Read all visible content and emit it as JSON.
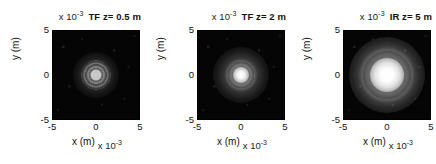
{
  "figure": {
    "background": "#ffffff",
    "colormap": "gray",
    "panel_count": 3
  },
  "common": {
    "exp_prefix": "x 10",
    "exp_power": "-3",
    "xlabel": "x (m)",
    "ylabel": "y (m)",
    "ytick_top": "5",
    "ytick_mid": "0",
    "ytick_bottom": "-5",
    "xtick_left": "-5",
    "xtick_mid": "0",
    "xtick_right": "5"
  },
  "panels": [
    {
      "id": "panel-tf-z05",
      "title": "TF z= 0.5 m",
      "method": "TF",
      "distance": "0.5 m"
    },
    {
      "id": "panel-tf-z2",
      "title": "TF z= 2 m",
      "method": "TF",
      "distance": "2 m"
    },
    {
      "id": "panel-ir-z5",
      "title": "IR z= 5 m",
      "method": "IR",
      "distance": "5 m"
    }
  ],
  "chart_data": [
    {
      "type": "heatmap",
      "title": "TF z= 0.5 m",
      "xlabel": "x (m)",
      "ylabel": "y (m)",
      "xlim": [
        -0.005,
        0.005
      ],
      "ylim": [
        -0.005,
        0.005
      ],
      "xticks": [
        -5,
        0,
        5
      ],
      "yticks": [
        -5,
        0,
        5
      ],
      "tick_scale": "x 10^-3",
      "colormap": "gray",
      "grid": false,
      "legend": "none",
      "description": "Simulated diffraction intensity pattern, transfer-function propagator at z = 0.5 m. Small concentric-ring central spot on a dark background.",
      "peak_position": [
        0,
        0
      ],
      "peak_intensity_relative": 0.45,
      "spot_radius_m": 0.0013
    },
    {
      "type": "heatmap",
      "title": "TF z= 2 m",
      "xlabel": "x (m)",
      "ylabel": "y (m)",
      "xlim": [
        -0.005,
        0.005
      ],
      "ylim": [
        -0.005,
        0.005
      ],
      "xticks": [
        -5,
        0,
        5
      ],
      "yticks": [
        -5,
        0,
        5
      ],
      "tick_scale": "x 10^-3",
      "colormap": "gray",
      "grid": false,
      "legend": "none",
      "description": "Simulated diffraction intensity pattern, transfer-function propagator at z = 2 m. Brighter medium-sized central lobe with faint surrounding rings.",
      "peak_position": [
        0,
        0
      ],
      "peak_intensity_relative": 1.0,
      "spot_radius_m": 0.0016
    },
    {
      "type": "heatmap",
      "title": "IR z= 5 m",
      "xlabel": "x (m)",
      "ylabel": "y (m)",
      "xlim": [
        -0.005,
        0.005
      ],
      "ylim": [
        -0.005,
        0.005
      ],
      "xticks": [
        -5,
        0,
        5
      ],
      "yticks": [
        -5,
        0,
        5
      ],
      "tick_scale": "x 10^-3",
      "colormap": "gray",
      "grid": false,
      "legend": "none",
      "description": "Simulated diffraction intensity pattern, impulse-response propagator at z = 5 m. Large bright saturated central lobe with broad diffuse halo.",
      "peak_position": [
        0,
        0
      ],
      "peak_intensity_relative": 1.0,
      "spot_radius_m": 0.0022
    }
  ]
}
